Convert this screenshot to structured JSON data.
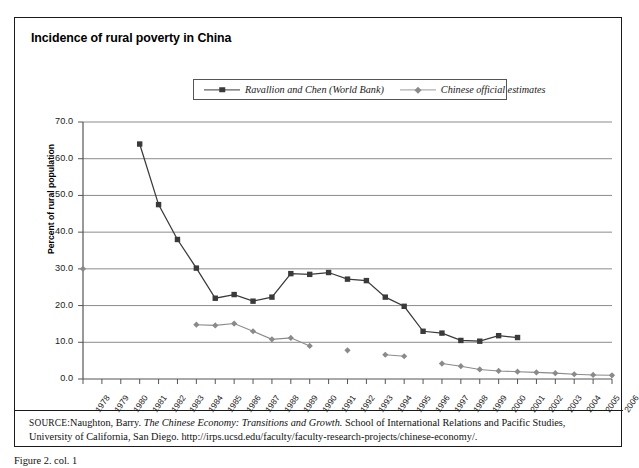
{
  "figure": {
    "title": "Incidence of rural poverty in China",
    "caption": "Figure 2.  col. 1",
    "source_label": "SOURCE:",
    "source_text_1": "Naughton, Barry. ",
    "source_italic": "The Chinese Economy: Transitions and Growth.",
    "source_text_2": " School of International Relations and Pacific Studies, University of California, San Diego. http://irps.ucsd.edu/faculty/faculty-research-projects/chinese-economy/."
  },
  "chart_data": {
    "type": "line",
    "title": "Incidence of rural poverty in China",
    "xlabel": "",
    "ylabel": "Percent of rural population",
    "ylim": [
      0,
      70
    ],
    "ytick_labels": [
      "0.0",
      "10.0",
      "20.0",
      "30.0",
      "40.0",
      "50.0",
      "60.0",
      "70.0"
    ],
    "ytick_values": [
      0,
      10,
      20,
      30,
      40,
      50,
      60,
      70
    ],
    "grid": true,
    "legend_position": "top-center",
    "x": [
      1978,
      1979,
      1980,
      1981,
      1982,
      1983,
      1984,
      1985,
      1986,
      1987,
      1988,
      1989,
      1990,
      1991,
      1992,
      1993,
      1994,
      1995,
      1996,
      1997,
      1998,
      1999,
      2000,
      2001,
      2002,
      2003,
      2004,
      2005,
      2006
    ],
    "xtick_labels": [
      "1978",
      "1979",
      "1980",
      "1981",
      "1982",
      "1983",
      "1984",
      "1985",
      "1986",
      "1987",
      "1988",
      "1989",
      "1990",
      "1991",
      "1992",
      "1993",
      "1994",
      "1995",
      "1996",
      "1997",
      "1998",
      "1999",
      "2000",
      "2001",
      "2002",
      "2003",
      "2004",
      "2005",
      "2006"
    ],
    "series": [
      {
        "name": "Ravallion and Chen (World Bank)",
        "marker": "square",
        "color": "#3a3a3a",
        "points": [
          {
            "x": 1981,
            "y": 64.0
          },
          {
            "x": 1982,
            "y": 47.5
          },
          {
            "x": 1983,
            "y": 38.0
          },
          {
            "x": 1984,
            "y": 30.2
          },
          {
            "x": 1985,
            "y": 22.0
          },
          {
            "x": 1986,
            "y": 23.0
          },
          {
            "x": 1987,
            "y": 21.2
          },
          {
            "x": 1988,
            "y": 22.3
          },
          {
            "x": 1989,
            "y": 28.7
          },
          {
            "x": 1990,
            "y": 28.5
          },
          {
            "x": 1991,
            "y": 29.0
          },
          {
            "x": 1992,
            "y": 27.2
          },
          {
            "x": 1993,
            "y": 26.8
          },
          {
            "x": 1994,
            "y": 22.3
          },
          {
            "x": 1995,
            "y": 19.8
          },
          {
            "x": 1996,
            "y": 13.0
          },
          {
            "x": 1997,
            "y": 12.5
          },
          {
            "x": 1998,
            "y": 10.5
          },
          {
            "x": 1999,
            "y": 10.3
          },
          {
            "x": 2000,
            "y": 11.8
          },
          {
            "x": 2001,
            "y": 11.3
          }
        ]
      },
      {
        "name": "Chinese official estimates",
        "marker": "diamond",
        "color": "#8a8a8a",
        "segments": [
          [
            {
              "x": 1978,
              "y": 30.0
            }
          ],
          [
            {
              "x": 1984,
              "y": 14.8
            },
            {
              "x": 1985,
              "y": 14.6
            },
            {
              "x": 1986,
              "y": 15.1
            },
            {
              "x": 1987,
              "y": 13.0
            },
            {
              "x": 1988,
              "y": 10.8
            },
            {
              "x": 1989,
              "y": 11.2
            },
            {
              "x": 1990,
              "y": 9.0
            }
          ],
          [
            {
              "x": 1992,
              "y": 7.8
            }
          ],
          [
            {
              "x": 1994,
              "y": 6.6
            },
            {
              "x": 1995,
              "y": 6.2
            }
          ],
          [
            {
              "x": 1997,
              "y": 4.2
            },
            {
              "x": 1998,
              "y": 3.5
            },
            {
              "x": 1999,
              "y": 2.6
            },
            {
              "x": 2000,
              "y": 2.2
            },
            {
              "x": 2001,
              "y": 2.0
            },
            {
              "x": 2002,
              "y": 1.8
            },
            {
              "x": 2003,
              "y": 1.6
            },
            {
              "x": 2004,
              "y": 1.3
            },
            {
              "x": 2005,
              "y": 1.1
            },
            {
              "x": 2006,
              "y": 1.0
            }
          ]
        ]
      }
    ]
  },
  "legend": {
    "entries": [
      {
        "label": "Ravallion and Chen (World Bank)"
      },
      {
        "label": "Chinese official estimates"
      }
    ]
  }
}
